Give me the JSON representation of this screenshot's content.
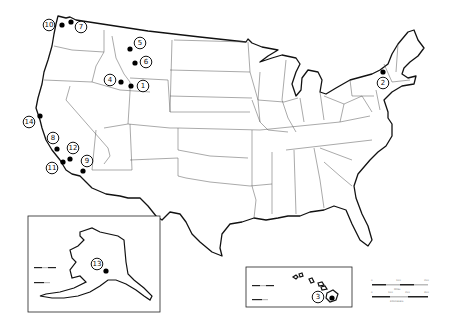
{
  "map": {
    "title": "",
    "colors": {
      "marker": "#000000",
      "outline": "#111111",
      "state_border": "#555555",
      "background": "#ffffff"
    },
    "markers": [
      {
        "id": "1",
        "label": "1",
        "dot": [
          131,
          86
        ],
        "ring": [
          143,
          86
        ]
      },
      {
        "id": "2",
        "label": "2",
        "dot": [
          383,
          72
        ],
        "ring": [
          383,
          83
        ]
      },
      {
        "id": "3",
        "label": "3",
        "dot": [
          332,
          298
        ],
        "ring": [
          318,
          297
        ]
      },
      {
        "id": "4",
        "label": "4",
        "dot": [
          121,
          82
        ],
        "ring": [
          110,
          80
        ]
      },
      {
        "id": "5",
        "label": "5",
        "dot": [
          130,
          49
        ],
        "ring": [
          140,
          43
        ]
      },
      {
        "id": "6",
        "label": "6",
        "dot": [
          135,
          63
        ],
        "ring": [
          146,
          62
        ]
      },
      {
        "id": "7",
        "label": "7",
        "dot": [
          71,
          22
        ],
        "ring": [
          81,
          27
        ]
      },
      {
        "id": "8",
        "label": "8",
        "dot": [
          57,
          149
        ],
        "ring": [
          53,
          138
        ]
      },
      {
        "id": "9",
        "label": "9",
        "dot": [
          83,
          171
        ],
        "ring": [
          87,
          161
        ]
      },
      {
        "id": "10",
        "label": "10",
        "dot": [
          62,
          25
        ],
        "ring": [
          49,
          25
        ]
      },
      {
        "id": "11",
        "label": "11",
        "dot": [
          63,
          162
        ],
        "ring": [
          52,
          168
        ]
      },
      {
        "id": "12",
        "label": "12",
        "dot": [
          70,
          159
        ],
        "ring": [
          73,
          148
        ]
      },
      {
        "id": "13",
        "label": "13",
        "dot": [
          106,
          271
        ],
        "ring": [
          97,
          264
        ]
      },
      {
        "id": "14",
        "label": "14",
        "dot": [
          40,
          116
        ],
        "ring": [
          29,
          122
        ]
      }
    ],
    "insets": {
      "alaska": {
        "name": "Alaska",
        "box": [
          28,
          216,
          132,
          96
        ]
      },
      "hawaii": {
        "name": "Hawaii",
        "box": [
          246,
          267,
          106,
          40
        ]
      }
    },
    "scale_bars": {
      "main": {
        "miles_ticks": [
          "0",
          "100",
          "200"
        ],
        "km_ticks": [
          "0",
          "100",
          "200",
          "300"
        ],
        "miles_unit": "Miles",
        "km_unit": "Kilometers"
      }
    }
  }
}
